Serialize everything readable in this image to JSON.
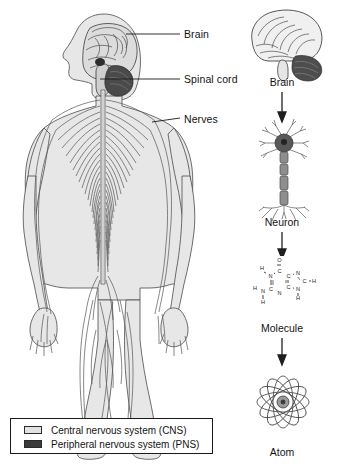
{
  "figure": {
    "background_color": "#ffffff",
    "line_color": "#2b2b2b",
    "cns_fill": "#e2e2e2",
    "pns_fill": "#3a3a3a",
    "label_color": "#131313"
  },
  "body_diagram": {
    "name": "human-figure-nervous-system",
    "labels": [
      {
        "id": "brain",
        "text": "Brain"
      },
      {
        "id": "spinal_cord",
        "text": "Spinal cord"
      },
      {
        "id": "nerves",
        "text": "Nerves"
      }
    ]
  },
  "levels_column": {
    "items": [
      {
        "id": "brain",
        "label": "Brain",
        "icon": "brain-lateral-icon"
      },
      {
        "id": "neuron",
        "label": "Neuron",
        "icon": "neuron-icon"
      },
      {
        "id": "molecule",
        "label": "Molecule",
        "icon": "guanine-molecule-icon"
      },
      {
        "id": "atom",
        "label": "Atom",
        "icon": "atom-orbit-icon"
      }
    ],
    "arrow_count": 3
  },
  "molecule_atoms": {
    "oxygen": "O",
    "nitrogen": "N",
    "carbon": "C",
    "hydrogen": "H",
    "labels": [
      "O",
      "H",
      "N",
      "C",
      "C",
      "N",
      "C",
      "H",
      "H",
      "N",
      "C",
      "N",
      "C",
      "N",
      "H",
      "H"
    ]
  },
  "legend": {
    "items": [
      {
        "label": "Central nervous system (CNS)",
        "swatch_color": "#e2e2e2"
      },
      {
        "label": "Peripheral nervous system (PNS)",
        "swatch_color": "#3a3a3a"
      }
    ]
  }
}
